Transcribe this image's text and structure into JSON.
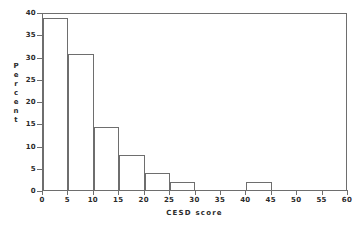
{
  "chart_data": {
    "type": "bar",
    "title": "",
    "subtitle": "",
    "xlabel": "CESD score",
    "ylabel": "Percent",
    "ylabel_letters": [
      "P",
      "e",
      "r",
      "c",
      "e",
      "n",
      "t"
    ],
    "xlim": [
      0,
      60
    ],
    "ylim": [
      0,
      40
    ],
    "xticks": [
      0,
      5,
      10,
      15,
      20,
      25,
      30,
      35,
      40,
      45,
      50,
      55,
      60
    ],
    "yticks": [
      0,
      5,
      10,
      15,
      20,
      25,
      30,
      35,
      40
    ],
    "xtick_labels": [
      "0",
      "5",
      "10",
      "15",
      "20",
      "25",
      "30",
      "35",
      "40",
      "45",
      "50",
      "55",
      "60"
    ],
    "ytick_labels": [
      "0",
      "5",
      "10",
      "15",
      "20",
      "25",
      "30",
      "35",
      "40"
    ],
    "grid": false,
    "legend": false,
    "bin_width": 5,
    "bar_edge_color": "#6e6e6e",
    "bar_fill_color": "none",
    "background_color": "#ffffff",
    "bins": [
      {
        "start": 0,
        "end": 5,
        "value": 38.8
      },
      {
        "start": 5,
        "end": 10,
        "value": 30.7
      },
      {
        "start": 10,
        "end": 15,
        "value": 14.3
      },
      {
        "start": 15,
        "end": 20,
        "value": 8.2
      },
      {
        "start": 20,
        "end": 25,
        "value": 4.1
      },
      {
        "start": 25,
        "end": 30,
        "value": 2.0
      },
      {
        "start": 30,
        "end": 35,
        "value": 0
      },
      {
        "start": 35,
        "end": 40,
        "value": 0
      },
      {
        "start": 40,
        "end": 45,
        "value": 2.0
      },
      {
        "start": 45,
        "end": 50,
        "value": 0
      },
      {
        "start": 50,
        "end": 55,
        "value": 0
      },
      {
        "start": 55,
        "end": 60,
        "value": 0
      }
    ],
    "categories": [
      "0-5",
      "5-10",
      "10-15",
      "15-20",
      "20-25",
      "25-30",
      "30-35",
      "35-40",
      "40-45",
      "45-50",
      "50-55",
      "55-60"
    ],
    "values": [
      38.8,
      30.7,
      14.3,
      8.2,
      4.1,
      2.0,
      0,
      0,
      2.0,
      0,
      0,
      0
    ]
  }
}
